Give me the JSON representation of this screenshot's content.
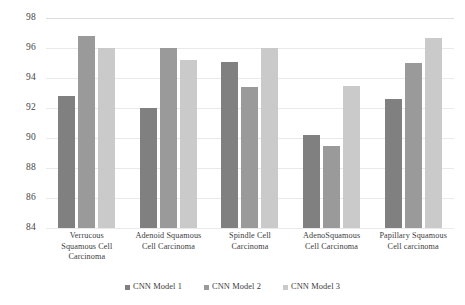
{
  "chart_data": {
    "type": "bar",
    "title": "",
    "subtitle": "",
    "xlabel": "",
    "ylabel": "",
    "ylim": [
      84,
      98
    ],
    "ytick_step": 2,
    "yticks": [
      98,
      96,
      94,
      92,
      90,
      88,
      86,
      84
    ],
    "grid": true,
    "legend_position": "bottom",
    "categories": [
      "Verrucous Squamous Cell Carcinoma",
      "Adenoid Squamous Cell Carcinoma",
      "Spindle Cell Carcinoma",
      "AdenoSquamous Cell Carcinoma",
      "Papillary Squamous Cell carcinoma"
    ],
    "category_lines": [
      [
        "Verrucous",
        "Squamous Cell",
        "Carcinoma"
      ],
      [
        "Adenoid Squamous",
        "Cell Carcinoma"
      ],
      [
        "Spindle Cell",
        "Carcinoma"
      ],
      [
        "AdenoSquamous",
        "Cell Carcinoma"
      ],
      [
        "Papillary Squamous",
        "Cell carcinoma"
      ]
    ],
    "series": [
      {
        "name": "CNN Model 1",
        "color": "#808080",
        "values": [
          92.8,
          92.0,
          95.1,
          90.2,
          92.6
        ]
      },
      {
        "name": "CNN Model 2",
        "color": "#9a9a9a",
        "values": [
          96.8,
          96.0,
          93.4,
          89.5,
          95.0
        ]
      },
      {
        "name": "CNN Model 3",
        "color": "#cacaca",
        "values": [
          96.0,
          95.2,
          96.0,
          93.5,
          96.7
        ]
      }
    ]
  },
  "legend": {
    "items": [
      {
        "label": "CNN Model 1",
        "color": "#808080"
      },
      {
        "label": "CNN Model 2",
        "color": "#9a9a9a"
      },
      {
        "label": "CNN Model 3",
        "color": "#cacaca"
      }
    ]
  }
}
